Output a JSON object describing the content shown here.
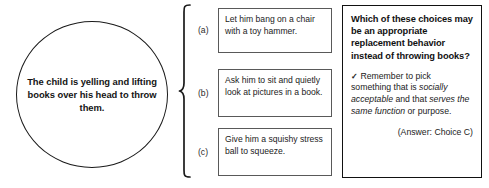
{
  "scenario": {
    "text": "The child is yelling and lifting books over his head to throw them."
  },
  "brace": {
    "icon": "curly-brace-right"
  },
  "choices": [
    {
      "letter": "(a)",
      "text": "Let him bang on a chair with a toy hammer."
    },
    {
      "letter": "(b)",
      "text": "Ask him to sit and quietly look at pictures in a book."
    },
    {
      "letter": "(c)",
      "text": "Give him a squishy stress ball to squeeze."
    }
  ],
  "panel": {
    "question": "Which of these choices may be an appropriate replacement behavior instead of throwing books?",
    "check_icon": "✓",
    "tip_part1": "Remember to pick something that is ",
    "tip_italic1": "socially acceptable",
    "tip_part2": " and that ",
    "tip_italic2": "serves the same function",
    "tip_part3": " or purpose.",
    "answer": "(Answer: Choice C)"
  },
  "colors": {
    "ink": "#111111",
    "box_border": "#595959",
    "panel_border": "#111111",
    "background": "#ffffff"
  }
}
